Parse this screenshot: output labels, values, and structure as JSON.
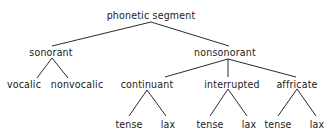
{
  "diagram": {
    "type": "tree",
    "line_color": "#2a2a2a",
    "text_color": "#1a1a1a",
    "root": {
      "label": "phonetic segment",
      "children": [
        {
          "label": "sonorant",
          "children": [
            {
              "label": "vocalic"
            },
            {
              "label": "nonvocalic"
            }
          ]
        },
        {
          "label": "nonsonorant",
          "children": [
            {
              "label": "continuant",
              "children": [
                {
                  "label": "tense"
                },
                {
                  "label": "lax"
                }
              ]
            },
            {
              "label": "interrupted",
              "children": [
                {
                  "label": "tense"
                },
                {
                  "label": "lax"
                }
              ]
            },
            {
              "label": "affricate",
              "children": [
                {
                  "label": "tense"
                },
                {
                  "label": "lax"
                }
              ]
            }
          ]
        }
      ]
    }
  }
}
